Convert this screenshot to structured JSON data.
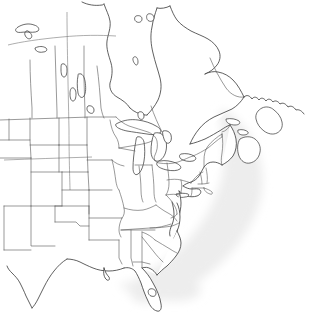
{
  "figure": {
    "type": "outline-map",
    "region_title": "North America",
    "width": 309,
    "height": 315,
    "background_color": "#ffffff",
    "line_color": "#2b2b2b",
    "border_color": "#555555",
    "ocean_shade_color": "#ededed",
    "projection_note": "conic",
    "visible_labels": []
  },
  "layers": {
    "ocean": {
      "name": "Atlantic Ocean shading",
      "fill": "#ededed",
      "blur_px": 6
    },
    "coastline": {
      "name": "Continental coastline",
      "stroke": "#2b2b2b"
    },
    "internal_borders": {
      "name": "State and province boundaries",
      "stroke": "#555555"
    },
    "graticule": {
      "name": "Latitude / longitude grid lines",
      "stroke": "#777777",
      "count": 3
    },
    "lakes": {
      "name": "Lakes and inland water",
      "stroke": "#2b2b2b",
      "items": [
        "Great Slave Lake",
        "Lake Athabasca",
        "Lake Winnipeg",
        "Reindeer Lake",
        "Lake Superior",
        "Lake Michigan",
        "Lake Huron",
        "Lake Erie",
        "Lake Ontario",
        "Lake Okeechobee"
      ]
    }
  },
  "paths": {
    "ocean_shade": "M232,116 C247,126 258,142 262,162 C266,184 260,206 248,226 C236,246 220,264 200,278 C183,290 166,298 150,300 C140,301 133,297 132,290 C131,282 139,276 150,270 C166,261 180,248 192,232 C206,214 216,194 220,174 C223,158 222,142 219,128 C217,118 222,112 232,116 Z",
    "coast_main": "M0,6 L16,6 L40,5 L70,4 L96,4 L110,6 L114,12 L112,20 L116,28 L122,30 L126,24 L132,20 L140,22 L144,30 L142,40 L146,48 L152,52 L156,46 L160,38 L166,34 L172,38 L176,46 L174,56 L178,64 L186,66 L192,60 L198,54 L206,52 L212,56 L216,64 L214,74 L218,82 L226,86 L234,84 L242,80 L250,78 L258,80 L264,86 L268,94 L272,100 L280,102 L288,100 L294,96 L300,94 L306,96 L309,100 L309,104 L302,108 L294,112 L286,114 L278,112 L270,110 L262,112 L256,118 L250,124 L244,126 L238,122 L232,118 L226,120 L220,126 L214,132 L206,134 L198,132 L192,128 L186,126 L180,130 L176,138 L174,148 L170,156 L164,160 L158,162 L152,166 L148,174 L146,184 L142,192 L136,198 L130,204 L126,212 L124,222 L120,232 L114,240 L106,246 L98,252 L90,258 L84,266 L80,276 L76,286 L70,294 L62,300 L54,304 L46,306 L38,304 L32,298 L28,290 L26,280 L24,270 L20,262 L14,256 L8,252 L2,250 L0,248",
    "graticule_horizontal_60": "M8,44 L20,41 L40,38 L60,36 L80,35 L100,35 L120,36 L140,38",
    "graticule_horizontal_37": "M4,159 L30,158 L60,157 L92,156 L120,156",
    "graticule_vertical_100": "M66,12 L66,36 L67,80 L68,130 L69,180 L70,230"
  },
  "geography": {
    "countries": [
      "Canada",
      "United States of America"
    ],
    "water_bodies": [
      "Hudson Bay",
      "Gulf of St. Lawrence",
      "Atlantic Ocean",
      "Gulf of Mexico",
      "Chesapeake Bay"
    ],
    "notable_peninsulas": [
      "Florida",
      "Nova Scotia",
      "Labrador",
      "Cape Cod",
      "Delmarva"
    ],
    "cropped_edges": [
      "west (Pacific coast not shown)",
      "south (Mexico not shown)"
    ]
  }
}
